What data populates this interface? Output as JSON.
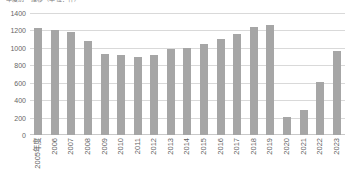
{
  "chart": {
    "title": "年度別　推移（単位：件）"
  },
  "chart_data": {
    "type": "bar",
    "title": "年度別　推移（単位：件）",
    "xlabel": "",
    "ylabel": "",
    "ylim": [
      0,
      1400
    ],
    "yticks": [
      1400,
      1200,
      1000,
      800,
      600,
      400,
      200,
      0
    ],
    "grid": true,
    "legend": false,
    "bar_color": "#a6a6a6",
    "categories": [
      "2005年度",
      "2006",
      "2007",
      "2008",
      "2009",
      "2010",
      "2011",
      "2012",
      "2013",
      "2014",
      "2015",
      "2016",
      "2017",
      "2018",
      "2019",
      "2020",
      "2021",
      "2022",
      "2023"
    ],
    "values": [
      1230,
      1200,
      1180,
      1080,
      930,
      920,
      890,
      920,
      985,
      995,
      1045,
      1100,
      1160,
      1245,
      1265,
      205,
      290,
      610,
      960
    ]
  }
}
